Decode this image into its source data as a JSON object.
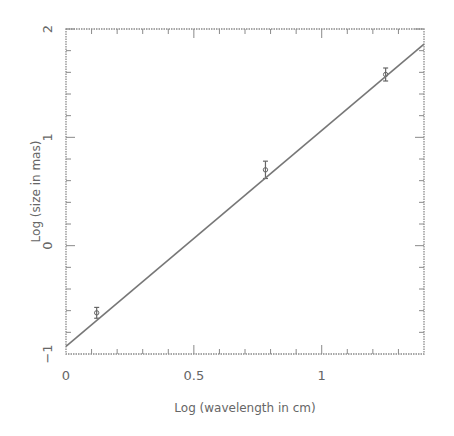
{
  "chart_data": {
    "type": "scatter",
    "title": "",
    "xlabel": "Log (wavelength in cm)",
    "ylabel": "Log (size in mas)",
    "xlim": [
      0,
      1.4
    ],
    "ylim": [
      -1,
      2
    ],
    "x_ticks": [
      {
        "value": 0,
        "label": "0"
      },
      {
        "value": 0.5,
        "label": "0.5"
      },
      {
        "value": 1,
        "label": "1"
      }
    ],
    "y_ticks": [
      {
        "value": -1,
        "label": "−1"
      },
      {
        "value": 0,
        "label": "0"
      },
      {
        "value": 1,
        "label": "1"
      },
      {
        "value": 2,
        "label": "2"
      }
    ],
    "grid": false,
    "legend": null,
    "series": [
      {
        "name": "measurements",
        "kind": "points_with_errorbars",
        "points": [
          {
            "x": 0.12,
            "y": -0.62,
            "yerr": 0.05
          },
          {
            "x": 0.78,
            "y": 0.7,
            "yerr": 0.08
          },
          {
            "x": 1.25,
            "y": 1.58,
            "yerr": 0.06
          }
        ]
      },
      {
        "name": "linear fit",
        "kind": "line",
        "points": [
          {
            "x": 0,
            "y": -0.93
          },
          {
            "x": 1.4,
            "y": 1.86
          }
        ]
      }
    ]
  }
}
